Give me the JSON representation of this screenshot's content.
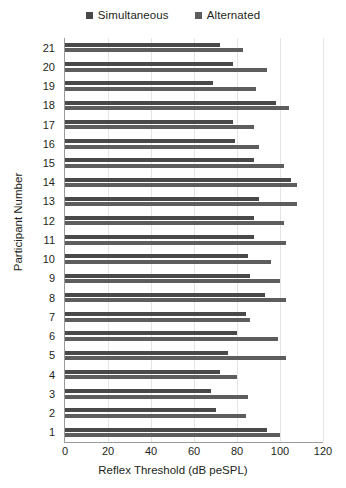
{
  "legend": {
    "position": "top-center",
    "items": [
      {
        "label": "Simultaneous",
        "color": "#494949",
        "icon": "square-swatch"
      },
      {
        "label": "Alternated",
        "color": "#5d5d5d",
        "icon": "square-swatch"
      }
    ]
  },
  "axes": {
    "x_title": "Reflex Threshold (dB peSPL)",
    "y_title": "Participant Number",
    "x_ticks": [
      "0",
      "20",
      "40",
      "60",
      "80",
      "100",
      "120"
    ],
    "y_ticks": [
      "21",
      "20",
      "19",
      "18",
      "17",
      "16",
      "15",
      "14",
      "13",
      "12",
      "11",
      "10",
      "9",
      "8",
      "7",
      "6",
      "5",
      "4",
      "3",
      "2",
      "1"
    ]
  },
  "chart_data": {
    "type": "bar",
    "orientation": "horizontal",
    "title": "",
    "xlabel": "Reflex Threshold (dB peSPL)",
    "ylabel": "Participant Number",
    "xlim": [
      0,
      120
    ],
    "xticks": [
      0,
      20,
      40,
      60,
      80,
      100,
      120
    ],
    "grid": true,
    "legend_position": "top-center",
    "categories": [
      "21",
      "20",
      "19",
      "18",
      "17",
      "16",
      "15",
      "14",
      "13",
      "12",
      "11",
      "10",
      "9",
      "8",
      "7",
      "6",
      "5",
      "4",
      "3",
      "2",
      "1"
    ],
    "series": [
      {
        "name": "Simultaneous",
        "color": "#494949",
        "values": [
          72,
          78,
          69,
          98,
          78,
          79,
          88,
          105,
          90,
          88,
          88,
          85,
          86,
          93,
          84,
          80,
          76,
          72,
          68,
          70,
          94
        ]
      },
      {
        "name": "Alternated",
        "color": "#5d5d5d",
        "values": [
          83,
          94,
          89,
          104,
          88,
          90,
          102,
          108,
          108,
          102,
          103,
          96,
          100,
          103,
          86,
          99,
          103,
          80,
          85,
          84,
          100
        ]
      }
    ]
  }
}
